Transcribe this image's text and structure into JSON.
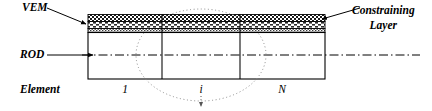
{
  "figure": {
    "type": "schematic-diagram",
    "background_color": "#ffffff",
    "line_color": "#000000"
  },
  "labels": {
    "vem": "VEM",
    "rod": "ROD",
    "element": "Element",
    "constraining_line1": "Constraining",
    "constraining_line2": "Layer"
  },
  "element_numbers": {
    "first": "1",
    "middle": "i",
    "last": "N"
  },
  "layers": [
    {
      "name": "constraining-layer",
      "pattern": "checkerboard",
      "order": 1,
      "fill": "#f2f2f2"
    },
    {
      "name": "vem-layer",
      "pattern": "brick-hatch",
      "order": 2,
      "fill": "#e8e8e8"
    },
    {
      "name": "vem-lower-band",
      "pattern": "fine-hatch",
      "order": 3,
      "fill": "#dcdcdc"
    },
    {
      "name": "rod-body",
      "pattern": "solid",
      "order": 4,
      "fill": "#ffffff"
    }
  ],
  "annotations": {
    "vem_leader": "arrow pointing down-right to the viscoelastic layer edge",
    "rod_leader": "horizontal arrow pointing right to the rod centerline",
    "constraining_leader": "arrow pointing down-left to the top constraining layer",
    "highlight_ellipse": "dotted ellipse enclosing element i",
    "callout_arrow": "dotted arrow pointing downward from element i"
  },
  "geometry": {
    "rod_left": 88,
    "rod_right": 325,
    "rod_top": 14,
    "rod_bottom": 79,
    "centerline_y": 55,
    "divider_1_x": 162,
    "divider_2_x": 240,
    "centerline_extends_to": 420
  }
}
